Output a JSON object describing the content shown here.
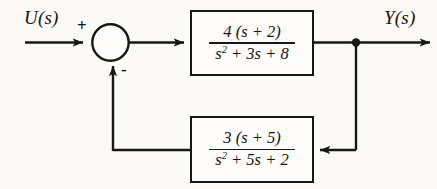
{
  "diagram": {
    "background_color": "#fbfaf7",
    "line_color": "#171717",
    "input_signal": "U(s)",
    "output_signal": "Y(s)",
    "summing_junction": {
      "input_sign": "+",
      "feedback_sign": "-"
    },
    "blocks": [
      {
        "name": "forward-path-block",
        "numerator": "4 (s + 2)",
        "denominator_base": "s",
        "denominator_exponent": "2",
        "denominator_rest": " + 3s + 8"
      },
      {
        "name": "feedback-path-block",
        "numerator": "3 (s + 5)",
        "denominator_base": "s",
        "denominator_exponent": "2",
        "denominator_rest": " + 5s + 2"
      }
    ]
  }
}
